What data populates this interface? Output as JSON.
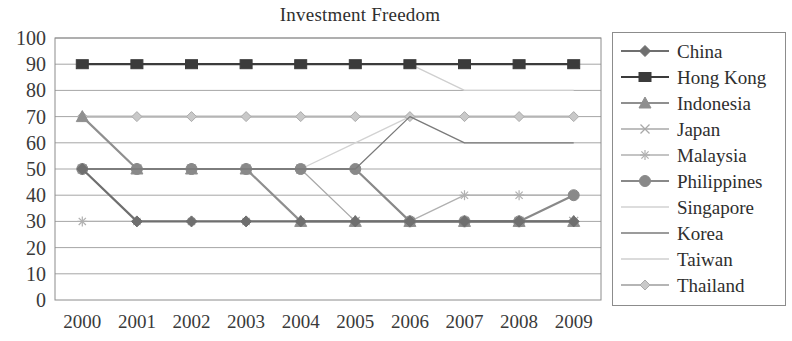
{
  "chart_data": {
    "type": "line",
    "title": "Investment Freedom",
    "xlabel": "",
    "ylabel": "",
    "ylim": [
      0,
      100
    ],
    "ytick_step": 10,
    "grid": true,
    "legend_position": "right",
    "categories": [
      "2000",
      "2001",
      "2002",
      "2003",
      "2004",
      "2005",
      "2006",
      "2007",
      "2008",
      "2009"
    ],
    "yticks": [
      "0",
      "10",
      "20",
      "30",
      "40",
      "50",
      "60",
      "70",
      "80",
      "90",
      "100"
    ],
    "series": [
      {
        "name": "China",
        "marker": "diamond",
        "color": "#6f6f6f",
        "values": [
          50,
          30,
          30,
          30,
          30,
          30,
          30,
          30,
          30,
          30
        ]
      },
      {
        "name": "Hong Kong",
        "marker": "square",
        "color": "#3b3b3b",
        "values": [
          90,
          90,
          90,
          90,
          90,
          90,
          90,
          90,
          90,
          90
        ]
      },
      {
        "name": "Indonesia",
        "marker": "triangle",
        "color": "#8f8f8f",
        "values": [
          70,
          50,
          50,
          50,
          30,
          30,
          30,
          30,
          30,
          30
        ]
      },
      {
        "name": "Japan",
        "marker": "x",
        "color": "#a8a8a8",
        "values": [
          50,
          50,
          50,
          50,
          50,
          30,
          30,
          30,
          30,
          30
        ]
      },
      {
        "name": "Malaysia",
        "marker": "asterisk",
        "color": "#b0b0b0",
        "values": [
          30,
          30,
          30,
          30,
          30,
          30,
          30,
          40,
          40,
          40
        ]
      },
      {
        "name": "Philippines",
        "marker": "circle",
        "color": "#898989",
        "values": [
          50,
          50,
          50,
          50,
          50,
          50,
          30,
          30,
          30,
          40
        ]
      },
      {
        "name": "Singapore",
        "marker": "none",
        "color": "#d2d2d2",
        "values": [
          50,
          50,
          50,
          50,
          50,
          60,
          70,
          70,
          70,
          70
        ]
      },
      {
        "name": "Korea",
        "marker": "none",
        "color": "#7a7a7a",
        "values": [
          50,
          50,
          50,
          50,
          50,
          50,
          70,
          60,
          60,
          60
        ]
      },
      {
        "name": "Taiwan",
        "marker": "none",
        "color": "#cfcfcf",
        "values": [
          90,
          90,
          90,
          90,
          90,
          90,
          90,
          80,
          80,
          80
        ]
      },
      {
        "name": "Thailand",
        "marker": "diamond-light",
        "color": "#b5b5b5",
        "values": [
          70,
          70,
          70,
          70,
          70,
          70,
          70,
          70,
          70,
          70
        ]
      }
    ]
  },
  "axis": {
    "frame_color": "#8c8c8c",
    "grid_color": "#a6a6a6"
  }
}
